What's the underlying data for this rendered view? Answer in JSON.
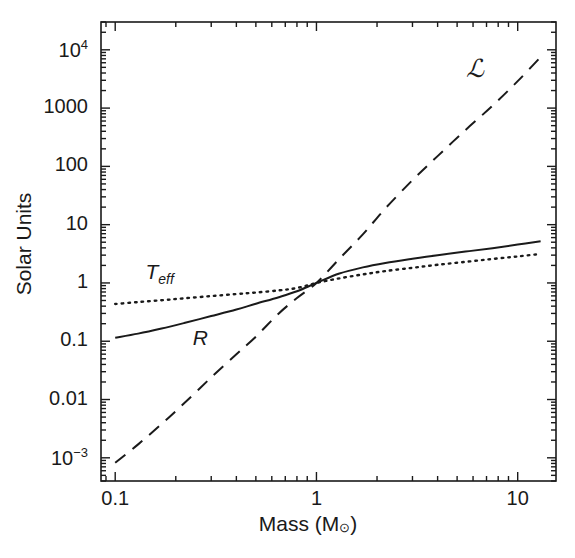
{
  "figure": {
    "background": "#ffffff",
    "ink": "#1a1a1a"
  },
  "axes": {
    "x": {
      "title_main": "Mass (M",
      "title_sun": "⊙",
      "title_close": ")",
      "title_full": "Mass (M⊙)",
      "scale": "log",
      "range": [
        0.085,
        15.5
      ],
      "tick_labels": [
        "0.1",
        "1",
        "10"
      ],
      "tick_values": [
        0.1,
        1,
        10
      ]
    },
    "y": {
      "title": "Solar Units",
      "scale": "log",
      "range": [
        0.0004,
        30000
      ],
      "tick_labels": [
        "10",
        "1000",
        "100",
        "10",
        "1",
        "0.1",
        "0.01",
        "10"
      ],
      "tick_label_parts": [
        {
          "base": "10",
          "exp": "4"
        },
        {
          "base": "1000",
          "exp": ""
        },
        {
          "base": "100",
          "exp": ""
        },
        {
          "base": "10",
          "exp": ""
        },
        {
          "base": "1",
          "exp": ""
        },
        {
          "base": "0.1",
          "exp": ""
        },
        {
          "base": "0.01",
          "exp": ""
        },
        {
          "base": "10",
          "exp": "−3"
        }
      ],
      "tick_values": [
        10000,
        1000,
        100,
        10,
        1,
        0.1,
        0.01,
        0.001
      ]
    }
  },
  "annotations": {
    "luminosity": {
      "text": "ℒ",
      "x": 6.2,
      "y": 4500
    },
    "temperature": {
      "text": "T",
      "sub": "eff",
      "x": 0.155,
      "y": 1.45
    },
    "radius": {
      "text": "R",
      "sub": "",
      "x": 0.26,
      "y": 0.105
    }
  },
  "chart_data": {
    "type": "line",
    "title": "",
    "xlabel": "Mass (M⊙)",
    "ylabel": "Solar Units",
    "xscale": "log",
    "yscale": "log",
    "xlim": [
      0.085,
      15.5
    ],
    "ylim": [
      0.0004,
      30000
    ],
    "grid": false,
    "legend": "inline-annotations",
    "series": [
      {
        "name": "ℒ",
        "label": "Luminosity",
        "style": "dashed",
        "color": "#1a1a1a",
        "x": [
          0.1,
          0.13,
          0.17,
          0.22,
          0.3,
          0.4,
          0.5,
          0.65,
          0.8,
          1.0,
          1.3,
          1.7,
          2.2,
          3.0,
          4.0,
          5.5,
          7.5,
          10.0,
          13.0
        ],
        "y": [
          0.00082,
          0.0017,
          0.0038,
          0.0086,
          0.024,
          0.06,
          0.12,
          0.3,
          0.55,
          1.0,
          2.6,
          6.8,
          19.0,
          58.0,
          150.0,
          420.0,
          1100.0,
          2900.0,
          7500.0
        ]
      },
      {
        "name": "R",
        "label": "Radius",
        "style": "solid",
        "color": "#1a1a1a",
        "x": [
          0.1,
          0.13,
          0.17,
          0.22,
          0.3,
          0.4,
          0.5,
          0.65,
          0.8,
          1.0,
          1.3,
          1.7,
          2.2,
          3.0,
          4.0,
          5.5,
          7.5,
          10.0,
          13.0
        ],
        "y": [
          0.115,
          0.135,
          0.165,
          0.205,
          0.27,
          0.35,
          0.44,
          0.57,
          0.72,
          1.0,
          1.45,
          1.85,
          2.2,
          2.6,
          3.0,
          3.45,
          3.95,
          4.55,
          5.2
        ]
      },
      {
        "name": "T_eff",
        "label": "Effective Temperature",
        "style": "dotted",
        "color": "#1a1a1a",
        "x": [
          0.1,
          0.13,
          0.17,
          0.22,
          0.3,
          0.4,
          0.5,
          0.65,
          0.8,
          1.0,
          1.3,
          1.7,
          2.2,
          3.0,
          4.0,
          5.5,
          7.5,
          10.0,
          13.0
        ],
        "y": [
          0.435,
          0.47,
          0.505,
          0.545,
          0.595,
          0.645,
          0.685,
          0.745,
          0.82,
          1.0,
          1.2,
          1.4,
          1.6,
          1.82,
          2.05,
          2.3,
          2.58,
          2.85,
          3.15
        ]
      }
    ]
  }
}
